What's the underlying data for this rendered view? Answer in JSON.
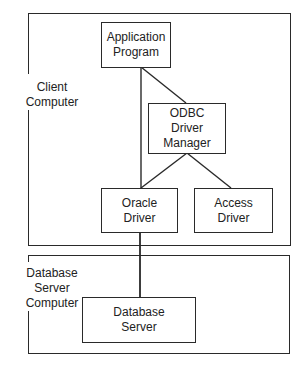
{
  "diagram": {
    "type": "architecture",
    "containers": [
      {
        "id": "client",
        "label": "Client Computer"
      },
      {
        "id": "server",
        "label": "Database\nServer Computer"
      }
    ],
    "nodes": [
      {
        "id": "app",
        "label": "Application\nProgram",
        "container": "client"
      },
      {
        "id": "odbc",
        "label": "ODBC\nDriver\nManager",
        "container": "client"
      },
      {
        "id": "oracle",
        "label": "Oracle\nDriver",
        "container": "client"
      },
      {
        "id": "access",
        "label": "Access\nDriver",
        "container": "client"
      },
      {
        "id": "dbserver",
        "label": "Database\nServer",
        "container": "server"
      }
    ],
    "edges": [
      {
        "from": "app",
        "to": "odbc"
      },
      {
        "from": "app",
        "to": "oracle"
      },
      {
        "from": "odbc",
        "to": "oracle"
      },
      {
        "from": "odbc",
        "to": "access"
      },
      {
        "from": "oracle",
        "to": "dbserver"
      }
    ],
    "colors": {
      "line": "#2a2a2a",
      "text": "#222222",
      "background": "#ffffff"
    }
  }
}
